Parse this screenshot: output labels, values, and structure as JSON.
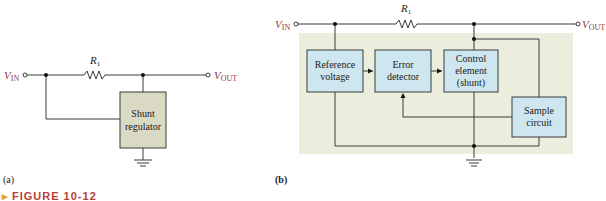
{
  "figure": {
    "caption": "FIGURE 10-12",
    "colors": {
      "wire": "#3a3a3a",
      "terminal_label": "#8b3a4a",
      "block_fill_a": "#d9d9c4",
      "block_fill_b": "#cde6ef",
      "panel_fill": "#eceedd",
      "caption_text": "#b5433a",
      "caption_marker": "#e8a020"
    }
  },
  "panel_a": {
    "label": "(a)",
    "vin": "V",
    "vin_sub": "IN",
    "vout": "V",
    "vout_sub": "OUT",
    "resistor": "R",
    "resistor_sub": "1",
    "block": {
      "line1": "Shunt",
      "line2": "regulator"
    }
  },
  "panel_b": {
    "label": "(b)",
    "vin": "V",
    "vin_sub": "IN",
    "vout": "V",
    "vout_sub": "OUT",
    "resistor": "R",
    "resistor_sub": "1",
    "blocks": [
      {
        "line1": "Reference",
        "line2": "voltage",
        "line3": ""
      },
      {
        "line1": "Error",
        "line2": "detector",
        "line3": ""
      },
      {
        "line1": "Control",
        "line2": "element",
        "line3": "(shunt)"
      },
      {
        "line1": "Sample",
        "line2": "circuit",
        "line3": ""
      }
    ]
  }
}
